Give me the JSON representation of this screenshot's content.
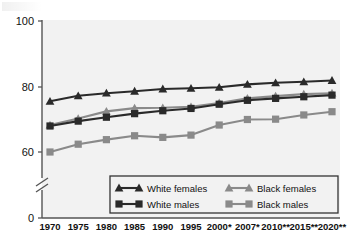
{
  "chart_data": {
    "type": "line",
    "title": "",
    "subtitle": "",
    "xlabel": "",
    "ylabel": "",
    "categories": [
      "1970",
      "1975",
      "1980",
      "1985",
      "1990",
      "1995",
      "2000*",
      "2007*",
      "2010**",
      "2015**",
      "2020**"
    ],
    "ylim": [
      0,
      100
    ],
    "yticks": [
      "0",
      "60",
      "80",
      "100"
    ],
    "ytick_values": [
      0,
      60,
      80,
      100
    ],
    "axis_break": true,
    "axis_break_between": [
      0,
      60
    ],
    "grid": false,
    "legend_position": "inside-bottom-center",
    "series": [
      {
        "name": "White females",
        "marker": "triangle",
        "color": "#2a2a2a",
        "values": [
          75.6,
          77.3,
          78.1,
          78.7,
          79.4,
          79.6,
          79.9,
          80.8,
          81.3,
          81.6,
          82.0
        ]
      },
      {
        "name": "White males",
        "marker": "square",
        "color": "#2a2a2a",
        "values": [
          68.0,
          69.5,
          70.7,
          71.8,
          72.7,
          73.4,
          74.7,
          75.9,
          76.5,
          77.0,
          77.5
        ]
      },
      {
        "name": "Black females",
        "marker": "triangle",
        "color": "#8a8a8a",
        "values": [
          68.3,
          70.3,
          72.5,
          73.5,
          73.6,
          73.9,
          75.1,
          76.5,
          77.2,
          77.8,
          78.1
        ]
      },
      {
        "name": "Black males",
        "marker": "square",
        "color": "#8a8a8a",
        "values": [
          60.0,
          62.4,
          63.8,
          65.0,
          64.5,
          65.2,
          68.3,
          70.0,
          70.1,
          71.4,
          72.4
        ]
      }
    ]
  },
  "axis": {
    "y_labels": [
      "100",
      "80",
      "60",
      "0"
    ],
    "x_labels": [
      "1970",
      "1975",
      "1980",
      "1985",
      "1990",
      "1995",
      "2000*",
      "2007*",
      "2010**",
      "2015**",
      "2020**"
    ]
  },
  "legend": {
    "entries": [
      {
        "label": "White females",
        "marker": "triangle",
        "color": "#2a2a2a"
      },
      {
        "label": "Black females",
        "marker": "triangle",
        "color": "#8a8a8a"
      },
      {
        "label": "White males",
        "marker": "square",
        "color": "#2a2a2a"
      },
      {
        "label": "Black males",
        "marker": "square",
        "color": "#8a8a8a"
      }
    ]
  },
  "colors": {
    "dark_series": "#2a2a2a",
    "light_series": "#8a8a8a",
    "plot_bg": "#f2f2f2",
    "axis": "#555555",
    "text": "#111111"
  }
}
